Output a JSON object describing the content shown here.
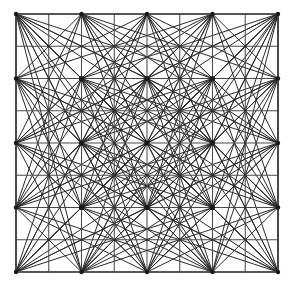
{
  "figure": {
    "kind": "line-art-diagram",
    "canvas": {
      "width": 295,
      "height": 286,
      "background": "#ffffff"
    },
    "square": {
      "left": 16,
      "top": 14,
      "right": 278,
      "bottom": 272,
      "width": 262,
      "height": 258,
      "divisions": 8,
      "cell_width": 32.75,
      "cell_height": 32.25,
      "border_color": "#3d3d3d",
      "border_width": 1.5
    },
    "grid": {
      "line_color": "#4a4a4a",
      "line_width": 1.05,
      "vertical_count": 9,
      "horizontal_count": 9,
      "node_count": 81
    },
    "chords": {
      "line_color": "#2a2a2a",
      "line_width": 1.0,
      "description": "Diagonal chords connecting even-index lattice nodes",
      "hub_step": 2,
      "hub_indices": [
        0,
        2,
        4,
        6,
        8
      ],
      "hub_count": 25
    },
    "nodes": {
      "hub_dot_color": "#1a1a1a",
      "hub_dot_radius": 2.6,
      "minor_dot_color": "#303030",
      "minor_dot_radius": 1.3
    }
  }
}
